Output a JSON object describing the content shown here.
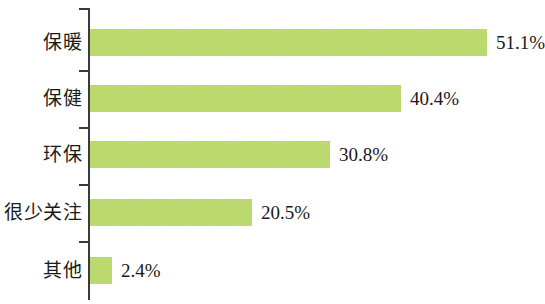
{
  "chart_data": {
    "type": "bar",
    "orientation": "horizontal",
    "title": "",
    "subtitle": "",
    "xlabel": "",
    "ylabel": "",
    "categories": [
      "保暖",
      "保健",
      "环保",
      "很少关注",
      "其他"
    ],
    "values": [
      51.1,
      40.4,
      30.8,
      20.5,
      2.4
    ],
    "value_labels": [
      "51.1%",
      "40.4%",
      "30.8%",
      "20.5%",
      "2.4%"
    ],
    "series": [
      {
        "name": "",
        "values": [
          51.1,
          40.4,
          30.8,
          20.5,
          2.4
        ],
        "color": "#b0d356"
      }
    ],
    "xlim": [
      0,
      55
    ],
    "grid": false,
    "legend": false,
    "legend_position": "none",
    "axis_color": "#3a3a3a",
    "bar_color": "#b0d356",
    "text_color": "#1a1a1a"
  },
  "rows": [
    {
      "label": "保暖",
      "value_label": "51.1%",
      "bar_px": 397,
      "top_px": 29,
      "tick_px": 8
    },
    {
      "label": "保健",
      "value_label": "40.4%",
      "bar_px": 311,
      "top_px": 85,
      "tick_px": 70
    },
    {
      "label": "环保",
      "value_label": "30.8%",
      "bar_px": 240,
      "top_px": 141,
      "tick_px": 127
    },
    {
      "label": "很少关注",
      "value_label": "20.5%",
      "bar_px": 162,
      "top_px": 199,
      "tick_px": 184
    },
    {
      "label": "其他",
      "value_label": "2.4%",
      "bar_px": 22,
      "top_px": 257,
      "tick_px": 241
    }
  ]
}
